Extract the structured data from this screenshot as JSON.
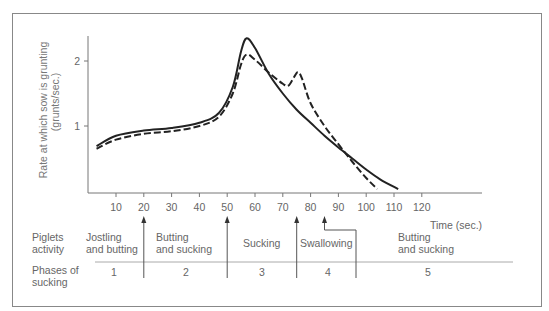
{
  "chart_data": {
    "type": "line",
    "title": "",
    "xlabel": "Time (sec.)",
    "ylabel": "Rate at which sow is grunting (grunts/sec.)",
    "ylabel_line1": "Rate at which sow is grunting",
    "ylabel_line2": "(grunts/sec.)",
    "xlim": [
      0,
      140
    ],
    "ylim": [
      0,
      2.4
    ],
    "x_ticks": [
      10,
      20,
      30,
      40,
      50,
      60,
      70,
      80,
      90,
      100,
      110,
      120
    ],
    "y_ticks": [
      1,
      2
    ],
    "grid": false,
    "legend": "none",
    "series": [
      {
        "name": "solid",
        "style": "solid",
        "x": [
          3,
          10,
          20,
          30,
          40,
          47,
          52,
          55,
          57,
          60,
          65,
          70,
          75,
          80,
          85,
          90,
          95,
          100,
          105,
          111.5
        ],
        "y": [
          0.69,
          0.85,
          0.93,
          0.97,
          1.05,
          1.2,
          1.6,
          2.15,
          2.35,
          2.2,
          1.8,
          1.5,
          1.25,
          1.05,
          0.85,
          0.67,
          0.5,
          0.33,
          0.18,
          0.03
        ]
      },
      {
        "name": "dashed",
        "style": "dashed",
        "x": [
          3,
          10,
          20,
          30,
          40,
          47,
          52,
          55,
          57,
          60,
          65,
          70,
          72,
          74,
          75.5,
          77,
          80,
          85,
          90,
          95,
          100,
          104
        ],
        "y": [
          0.65,
          0.79,
          0.88,
          0.92,
          1.0,
          1.14,
          1.5,
          1.95,
          2.1,
          2.02,
          1.82,
          1.65,
          1.62,
          1.75,
          1.83,
          1.72,
          1.35,
          1.0,
          0.72,
          0.45,
          0.2,
          0.03
        ]
      }
    ],
    "annotations": [
      {
        "type": "arrow",
        "x": 20
      },
      {
        "type": "arrow",
        "x": 50
      },
      {
        "type": "arrow",
        "x": 75
      },
      {
        "type": "bent-arrow",
        "x": 85
      }
    ]
  },
  "table": {
    "row1_label": "Piglets\nactivity",
    "row2_label": "Phases of\nsucking",
    "phases": [
      {
        "activity": "Jostling\nand butting",
        "phase": "1"
      },
      {
        "activity": "Butting\nand sucking",
        "phase": "2"
      },
      {
        "activity": "Sucking",
        "phase": "3"
      },
      {
        "activity": "Swallowing",
        "phase": "4"
      },
      {
        "activity": "Butting\nand sucking",
        "phase": "5"
      }
    ]
  }
}
